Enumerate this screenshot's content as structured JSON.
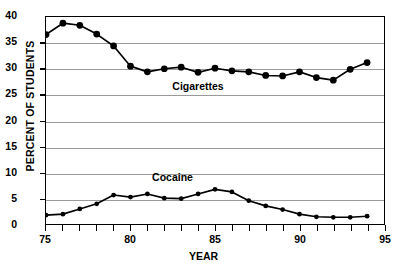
{
  "chart_data": {
    "type": "line",
    "title": "",
    "xlabel": "YEAR",
    "ylabel": "PERCENT OF STUDENTS",
    "xlim": [
      75,
      95
    ],
    "ylim": [
      0,
      40
    ],
    "ytick_values": [
      0,
      5,
      10,
      15,
      20,
      25,
      30,
      35,
      40
    ],
    "ytick_labels": [
      "0",
      "5",
      "10",
      "15",
      "20",
      "25",
      "30",
      "35",
      "40"
    ],
    "xtick_values": [
      75,
      80,
      85,
      90,
      95
    ],
    "xtick_labels": [
      "75",
      "80",
      "85",
      "90",
      "95"
    ],
    "xminor_step": 1,
    "grid": "horizontal",
    "legend_position": "inline-annotation",
    "marker": "filled-circle",
    "line_color": "#000000",
    "grid_color": "#9a9a9a",
    "frame_color": "#000000",
    "x": [
      75,
      76,
      77,
      78,
      79,
      80,
      81,
      82,
      83,
      84,
      85,
      86,
      87,
      88,
      89,
      90,
      91,
      92,
      93,
      94
    ],
    "series": [
      {
        "name": "Cigarettes",
        "label_x": 84,
        "label_y": 26.5,
        "values": [
          36.6,
          38.8,
          38.4,
          36.7,
          34.4,
          30.5,
          29.4,
          30.0,
          30.3,
          29.3,
          30.1,
          29.6,
          29.4,
          28.7,
          28.6,
          29.4,
          28.3,
          27.8,
          29.9,
          31.2
        ]
      },
      {
        "name": "Cocaine",
        "label_x": 82.5,
        "label_y": 9.0,
        "values": [
          1.7,
          1.9,
          2.9,
          3.9,
          5.6,
          5.2,
          5.8,
          5.0,
          4.9,
          5.8,
          6.7,
          6.2,
          4.5,
          3.5,
          2.8,
          1.9,
          1.4,
          1.3,
          1.3,
          1.5
        ]
      }
    ]
  }
}
